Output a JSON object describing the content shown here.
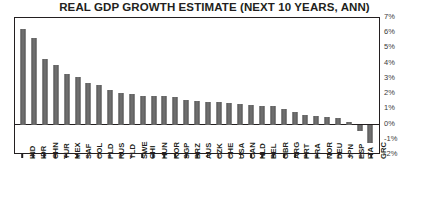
{
  "chart_data": {
    "type": "bar",
    "title": "REAL GDP GROWTH ESTIMATE (NEXT 10 YEARS, ANN)",
    "xlabel": "",
    "ylabel": "",
    "ylim": [
      -2,
      7
    ],
    "grid": false,
    "legend": null,
    "ytick_labels": [
      "7%",
      "6%",
      "5%",
      "4%",
      "3%",
      "2%",
      "1%",
      "0%",
      "-1%",
      "-2%"
    ],
    "ytick_values": [
      7,
      6,
      5,
      4,
      3,
      2,
      1,
      0,
      -1,
      -2
    ],
    "categories": [
      "IND",
      "IDR",
      "CHN",
      "TUR",
      "MEX",
      "SAF",
      "COL",
      "PLD",
      "RUS",
      "TLD",
      "SWE",
      "CHI",
      "HUN",
      "KOR",
      "SGP",
      "BRZ",
      "AUS",
      "CZK",
      "CHE",
      "USA",
      "CAN",
      "NLD",
      "BEL",
      "GBR",
      "ARG",
      "PRT",
      "FRA",
      "NOR",
      "DEU",
      "JPN",
      "ESP",
      "ITA",
      "GRC"
    ],
    "values": [
      6.3,
      5.7,
      4.3,
      3.9,
      3.3,
      3.1,
      2.7,
      2.6,
      2.3,
      2.1,
      2.0,
      1.9,
      1.9,
      1.85,
      1.8,
      1.6,
      1.55,
      1.5,
      1.45,
      1.4,
      1.35,
      1.3,
      1.25,
      1.2,
      1.0,
      0.8,
      0.6,
      0.55,
      0.5,
      0.45,
      0.2,
      -0.4,
      -1.2
    ],
    "bar_color": "#6e6e6e",
    "axis_color": "#231f20"
  }
}
